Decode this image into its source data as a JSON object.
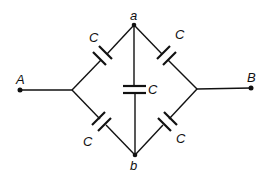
{
  "diagram": {
    "type": "capacitor-bridge-circuit",
    "terminals": [
      {
        "id": "A",
        "label": "A"
      },
      {
        "id": "B",
        "label": "B"
      }
    ],
    "nodes": [
      {
        "id": "a",
        "label": "a"
      },
      {
        "id": "b",
        "label": "b"
      }
    ],
    "capacitors": [
      {
        "position": "upper-left",
        "label": "C"
      },
      {
        "position": "upper-right",
        "label": "C"
      },
      {
        "position": "center",
        "label": "C"
      },
      {
        "position": "lower-left",
        "label": "C"
      },
      {
        "position": "lower-right",
        "label": "C"
      }
    ]
  }
}
